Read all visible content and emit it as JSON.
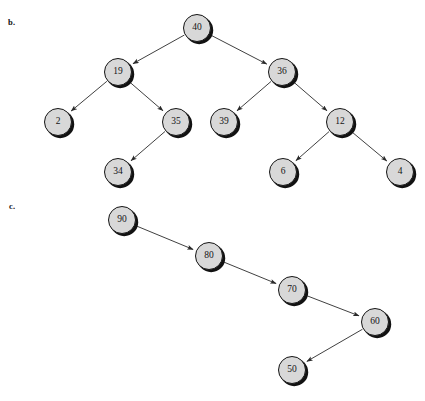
{
  "figure": {
    "background_color": "#ffffff",
    "node_fill_color": "#d8d8d8",
    "node_border_color": "#151515",
    "edge_color": "#2a2a2a",
    "text_color": "#141414",
    "node_radius": 14
  },
  "parts": [
    {
      "id": "b",
      "label": "b.",
      "label_x": 8,
      "label_y": 17,
      "structure": "binary-tree",
      "nodes": [
        {
          "id": "b40",
          "value": "40",
          "cx": 197,
          "cy": 28
        },
        {
          "id": "b19",
          "value": "19",
          "cx": 118,
          "cy": 72
        },
        {
          "id": "b36",
          "value": "36",
          "cx": 282,
          "cy": 72
        },
        {
          "id": "b2",
          "value": "2",
          "cx": 58,
          "cy": 122
        },
        {
          "id": "b35",
          "value": "35",
          "cx": 176,
          "cy": 122
        },
        {
          "id": "b39",
          "value": "39",
          "cx": 224,
          "cy": 122
        },
        {
          "id": "b12",
          "value": "12",
          "cx": 340,
          "cy": 122
        },
        {
          "id": "b34",
          "value": "34",
          "cx": 118,
          "cy": 172
        },
        {
          "id": "b6",
          "value": "6",
          "cx": 283,
          "cy": 172
        },
        {
          "id": "b4",
          "value": "4",
          "cx": 400,
          "cy": 172
        }
      ],
      "edges": [
        {
          "from": "b40",
          "to": "b19"
        },
        {
          "from": "b40",
          "to": "b36"
        },
        {
          "from": "b19",
          "to": "b2"
        },
        {
          "from": "b19",
          "to": "b35"
        },
        {
          "from": "b35",
          "to": "b34"
        },
        {
          "from": "b36",
          "to": "b39"
        },
        {
          "from": "b36",
          "to": "b12"
        },
        {
          "from": "b12",
          "to": "b6"
        },
        {
          "from": "b12",
          "to": "b4"
        }
      ]
    },
    {
      "id": "c",
      "label": "c.",
      "label_x": 9,
      "label_y": 201,
      "structure": "right-skewed-chain",
      "nodes": [
        {
          "id": "c90",
          "value": "90",
          "cx": 122,
          "cy": 220
        },
        {
          "id": "c80",
          "value": "80",
          "cx": 209,
          "cy": 256
        },
        {
          "id": "c70",
          "value": "70",
          "cx": 292,
          "cy": 290
        },
        {
          "id": "c60",
          "value": "60",
          "cx": 375,
          "cy": 322
        },
        {
          "id": "c50",
          "value": "50",
          "cx": 292,
          "cy": 370
        }
      ],
      "edges": [
        {
          "from": "c90",
          "to": "c80"
        },
        {
          "from": "c80",
          "to": "c70"
        },
        {
          "from": "c70",
          "to": "c60"
        },
        {
          "from": "c60",
          "to": "c50"
        }
      ]
    }
  ]
}
